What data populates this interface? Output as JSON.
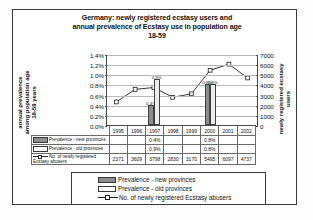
{
  "chart_data": {
    "type": "bar",
    "title": "Germany: newly registered ecstasy users and annual prevalence of Ecstasy use in population age 18-59",
    "title_lines": [
      "Germany: newly registered ecstasy users and",
      "annual prevalence of Ecstasy use in population age",
      "18-59"
    ],
    "categories": [
      "1995",
      "1996",
      "1997",
      "1998",
      "1999",
      "2000",
      "2001",
      "2002"
    ],
    "ylabel_left": "annual prevalence among population age 18-59 years",
    "ylabel_left_lines": [
      "annual prevalence",
      "among population age",
      "18-59 years"
    ],
    "ylabel_right": "newly registered ecstasy users",
    "ylabel_right_lines": [
      "newly registered ecstasy",
      "users"
    ],
    "xlabel": "",
    "ylim_left": [
      0,
      1.4
    ],
    "ylim_right": [
      0,
      7000
    ],
    "yticks_left": [
      "1.4%",
      "1.2%",
      "1.0%",
      "0.8%",
      "0.6%",
      "0.4%",
      "0.2%",
      "0.0%"
    ],
    "yticks_right": [
      "7000",
      "6000",
      "5000",
      "4000",
      "3000",
      "2000",
      "1000",
      "0"
    ],
    "grid": true,
    "legend_position": "bottom",
    "series": [
      {
        "name": "Prevalence - new provinces",
        "type": "bar",
        "unit": "percent",
        "color": "#8d8d8d",
        "values": [
          null,
          null,
          0.4,
          null,
          null,
          0.8,
          null,
          null
        ],
        "labels": [
          "",
          "",
          "0.4%",
          "",
          "",
          "0.8%",
          "",
          ""
        ]
      },
      {
        "name": "Prevalence - old provinces",
        "type": "bar",
        "unit": "percent",
        "color": "#ececec",
        "values": [
          null,
          null,
          0.9,
          null,
          null,
          0.8,
          null,
          null
        ],
        "labels": [
          "",
          "",
          "0.9%",
          "",
          "",
          "0.8%",
          "",
          ""
        ]
      },
      {
        "name": "No. of newly registered Ecstasy abusers",
        "type": "line",
        "unit": "count",
        "color": "#1f1f1f",
        "values": [
          2371,
          3609,
          3798,
          2830,
          3170,
          5495,
          6097,
          4737
        ],
        "labels": [
          "2371",
          "3609",
          "3798",
          "2830",
          "3170",
          "5495",
          "6097",
          "4737"
        ]
      }
    ]
  },
  "table": {
    "year_header": [
      "1995",
      "1996",
      "1997",
      "1998",
      "1999",
      "2000",
      "2001",
      "2002"
    ],
    "rows": [
      {
        "label": "Prevalence - new provinces",
        "marker": "bar-swatch-new",
        "cells": [
          "",
          "",
          "0.4%",
          "",
          "",
          "0.8%",
          "",
          ""
        ]
      },
      {
        "label": "Prevalence - old provinces",
        "marker": "bar-swatch-old",
        "cells": [
          "",
          "",
          "0.9%",
          "",
          "",
          "0.8%",
          "",
          ""
        ]
      },
      {
        "label": "No. of newly registered Ecstasy abusers",
        "marker": "line-marker",
        "cells": [
          "2371",
          "3609",
          "3798",
          "2830",
          "3170",
          "5495",
          "6097",
          "4737"
        ]
      }
    ]
  },
  "legend": {
    "items": [
      {
        "label": "Prevalence - new provinces",
        "marker": "swatch-new"
      },
      {
        "label": "Prevalence - old provinces",
        "marker": "swatch-old"
      },
      {
        "label": "No. of newly registered Ecstasy abusers",
        "marker": "line-square"
      }
    ]
  },
  "colors": {
    "bar_new": "#8d8d8d",
    "bar_old": "#ececec",
    "line": "#1f1f1f",
    "grid": "#b9b9b9",
    "frame": "#3a3a3a"
  }
}
